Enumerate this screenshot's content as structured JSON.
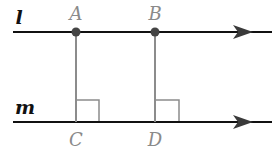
{
  "diagram": {
    "type": "parallel-lines-perpendicular-distance",
    "lines": [
      {
        "id": "l",
        "label": "l",
        "y": 32,
        "x1": 13,
        "x2": 272,
        "arrow_x": 252
      },
      {
        "id": "m",
        "label": "m",
        "y": 122,
        "x1": 13,
        "x2": 272,
        "arrow_x": 252
      }
    ],
    "points": [
      {
        "id": "A",
        "label": "A",
        "x": 76,
        "y": 32,
        "on_line": "l",
        "dot": true
      },
      {
        "id": "B",
        "label": "B",
        "x": 155,
        "y": 32,
        "on_line": "l",
        "dot": true
      },
      {
        "id": "C",
        "label": "C",
        "x": 76,
        "y": 122,
        "on_line": "m",
        "dot": false
      },
      {
        "id": "D",
        "label": "D",
        "x": 155,
        "y": 122,
        "on_line": "m",
        "dot": false
      }
    ],
    "segments": [
      {
        "from": "A",
        "to": "C",
        "perpendicular": true
      },
      {
        "from": "B",
        "to": "D",
        "perpendicular": true
      }
    ],
    "right_angle_marks": [
      "C",
      "D"
    ],
    "colors": {
      "line": "#111111",
      "segment": "#8c8c8c",
      "point": "#444444",
      "point_label": "#8a8a8a",
      "line_label": "#111111"
    }
  }
}
